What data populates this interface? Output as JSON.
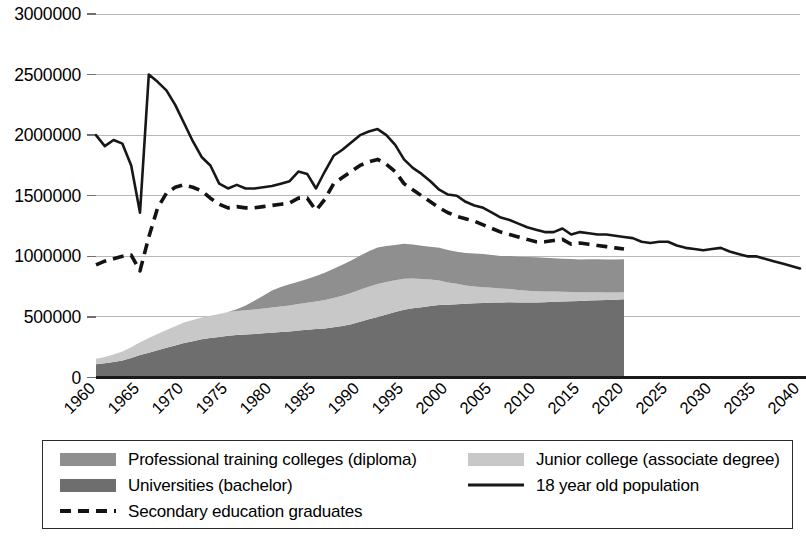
{
  "chart_data": {
    "type": "area",
    "title": "",
    "subtitle": "",
    "xlabel": "",
    "ylabel": "",
    "xlim": [
      1960,
      2040
    ],
    "ylim": [
      0,
      3000000
    ],
    "grid": true,
    "stacked": true,
    "legend_position": "bottom",
    "x_tick_labels": [
      "1960",
      "1965",
      "1970",
      "1975",
      "1980",
      "1985",
      "1990",
      "1995",
      "2000",
      "2005",
      "2010",
      "2015",
      "2020",
      "2025",
      "2030",
      "2035",
      "2040"
    ],
    "y_tick_labels": [
      "0",
      "500000",
      "1000000",
      "1500000",
      "2000000",
      "2500000",
      "3000000"
    ],
    "y_tick_values": [
      0,
      500000,
      1000000,
      1500000,
      2000000,
      2500000,
      3000000
    ],
    "area_x_start": 1960,
    "area_x_end": 2020,
    "area_x": [
      1960,
      1961,
      1962,
      1963,
      1964,
      1965,
      1966,
      1967,
      1968,
      1969,
      1970,
      1971,
      1972,
      1973,
      1974,
      1975,
      1976,
      1977,
      1978,
      1979,
      1980,
      1981,
      1982,
      1983,
      1984,
      1985,
      1986,
      1987,
      1988,
      1989,
      1990,
      1991,
      1992,
      1993,
      1994,
      1995,
      1996,
      1997,
      1998,
      1999,
      2000,
      2001,
      2002,
      2003,
      2004,
      2005,
      2006,
      2007,
      2008,
      2009,
      2010,
      2011,
      2012,
      2013,
      2014,
      2015,
      2016,
      2017,
      2018,
      2019,
      2020
    ],
    "series": [
      {
        "name": "Universities (bachelor)",
        "legend_key": "universities",
        "color": "#6e6e6e",
        "type": "stacked-area",
        "values": [
          110000,
          118000,
          128000,
          140000,
          160000,
          185000,
          205000,
          225000,
          245000,
          265000,
          285000,
          300000,
          315000,
          325000,
          335000,
          345000,
          350000,
          355000,
          360000,
          365000,
          370000,
          375000,
          380000,
          388000,
          395000,
          400000,
          405000,
          415000,
          425000,
          440000,
          460000,
          480000,
          500000,
          520000,
          540000,
          560000,
          572000,
          580000,
          590000,
          598000,
          600000,
          605000,
          608000,
          612000,
          615000,
          618000,
          620000,
          622000,
          620000,
          618000,
          620000,
          622000,
          625000,
          628000,
          630000,
          632000,
          635000,
          638000,
          640000,
          642000,
          645000
        ]
      },
      {
        "name": "Junior college (associate degree)",
        "legend_key": "junior_college",
        "color": "#c8c8c8",
        "type": "stacked-area",
        "values": [
          45000,
          52000,
          62000,
          75000,
          90000,
          105000,
          120000,
          135000,
          148000,
          158000,
          168000,
          175000,
          180000,
          185000,
          190000,
          195000,
          198000,
          200000,
          202000,
          205000,
          208000,
          212000,
          215000,
          218000,
          222000,
          228000,
          235000,
          242000,
          250000,
          258000,
          265000,
          270000,
          272000,
          268000,
          262000,
          255000,
          245000,
          232000,
          218000,
          202000,
          185000,
          168000,
          152000,
          140000,
          130000,
          122000,
          115000,
          108000,
          102000,
          98000,
          92000,
          88000,
          84000,
          80000,
          76000,
          72000,
          68000,
          65000,
          62000,
          60000,
          58000
        ]
      },
      {
        "name": "Professional training colleges (diploma)",
        "legend_key": "professional_training",
        "color": "#8f8f8f",
        "type": "stacked-area",
        "values": [
          0,
          0,
          0,
          0,
          0,
          0,
          0,
          0,
          0,
          0,
          0,
          0,
          0,
          0,
          0,
          0,
          15000,
          40000,
          72000,
          105000,
          140000,
          160000,
          175000,
          185000,
          195000,
          210000,
          225000,
          240000,
          255000,
          268000,
          280000,
          292000,
          300000,
          298000,
          292000,
          288000,
          280000,
          275000,
          272000,
          270000,
          268000,
          265000,
          268000,
          272000,
          275000,
          272000,
          268000,
          272000,
          275000,
          278000,
          280000,
          278000,
          275000,
          272000,
          272000,
          270000,
          272000,
          272000,
          272000,
          272000,
          272000
        ]
      },
      {
        "name": "18 year old population",
        "legend_key": "population_18",
        "color": "#171717",
        "type": "line",
        "style": "solid",
        "x": [
          1960,
          1961,
          1962,
          1963,
          1964,
          1965,
          1966,
          1967,
          1968,
          1969,
          1970,
          1971,
          1972,
          1973,
          1974,
          1975,
          1976,
          1977,
          1978,
          1979,
          1980,
          1981,
          1982,
          1983,
          1984,
          1985,
          1986,
          1987,
          1988,
          1989,
          1990,
          1991,
          1992,
          1993,
          1994,
          1995,
          1996,
          1997,
          1998,
          1999,
          2000,
          2001,
          2002,
          2003,
          2004,
          2005,
          2006,
          2007,
          2008,
          2009,
          2010,
          2011,
          2012,
          2013,
          2014,
          2015,
          2016,
          2017,
          2018,
          2019,
          2020,
          2021,
          2022,
          2023,
          2024,
          2025,
          2026,
          2027,
          2028,
          2029,
          2030,
          2031,
          2032,
          2033,
          2034,
          2035,
          2036,
          2037,
          2038,
          2039,
          2040
        ],
        "values": [
          2000000,
          1910000,
          1960000,
          1930000,
          1750000,
          1360000,
          2500000,
          2440000,
          2370000,
          2250000,
          2100000,
          1950000,
          1820000,
          1750000,
          1600000,
          1560000,
          1590000,
          1560000,
          1560000,
          1570000,
          1580000,
          1600000,
          1620000,
          1700000,
          1680000,
          1560000,
          1700000,
          1830000,
          1880000,
          1940000,
          2000000,
          2030000,
          2050000,
          2000000,
          1920000,
          1800000,
          1730000,
          1680000,
          1620000,
          1550000,
          1510000,
          1500000,
          1450000,
          1420000,
          1400000,
          1360000,
          1320000,
          1300000,
          1270000,
          1240000,
          1220000,
          1200000,
          1200000,
          1230000,
          1180000,
          1200000,
          1190000,
          1180000,
          1180000,
          1170000,
          1160000,
          1150000,
          1120000,
          1110000,
          1120000,
          1120000,
          1090000,
          1070000,
          1060000,
          1050000,
          1060000,
          1070000,
          1040000,
          1020000,
          1000000,
          1000000,
          980000,
          960000,
          940000,
          920000,
          900000
        ]
      },
      {
        "name": "Secondary education graduates",
        "legend_key": "secondary_graduates",
        "color": "#131313",
        "type": "line",
        "style": "dashed",
        "x": [
          1960,
          1961,
          1962,
          1963,
          1964,
          1965,
          1966,
          1967,
          1968,
          1969,
          1970,
          1971,
          1972,
          1973,
          1974,
          1975,
          1976,
          1977,
          1978,
          1979,
          1980,
          1981,
          1982,
          1983,
          1984,
          1985,
          1986,
          1987,
          1988,
          1989,
          1990,
          1991,
          1992,
          1993,
          1994,
          1995,
          1996,
          1997,
          1998,
          1999,
          2000,
          2001,
          2002,
          2003,
          2004,
          2005,
          2006,
          2007,
          2008,
          2009,
          2010,
          2011,
          2012,
          2013,
          2014,
          2015,
          2016,
          2017,
          2018,
          2019,
          2020
        ],
        "values": [
          930000,
          960000,
          980000,
          1000000,
          1010000,
          880000,
          1160000,
          1400000,
          1520000,
          1570000,
          1590000,
          1570000,
          1540000,
          1480000,
          1430000,
          1400000,
          1410000,
          1400000,
          1400000,
          1410000,
          1420000,
          1430000,
          1440000,
          1480000,
          1480000,
          1380000,
          1470000,
          1600000,
          1650000,
          1700000,
          1750000,
          1780000,
          1800000,
          1760000,
          1700000,
          1600000,
          1550000,
          1500000,
          1450000,
          1400000,
          1360000,
          1330000,
          1310000,
          1290000,
          1260000,
          1230000,
          1200000,
          1180000,
          1160000,
          1140000,
          1120000,
          1120000,
          1130000,
          1140000,
          1100000,
          1110000,
          1100000,
          1090000,
          1080000,
          1070000,
          1060000
        ]
      }
    ],
    "legend": {
      "items": [
        {
          "label": "Professional training colleges (diploma)",
          "marker": "swatch",
          "color": "#8f8f8f",
          "column": 1,
          "row": 1
        },
        {
          "label": "Junior college (associate degree)",
          "marker": "swatch",
          "color": "#c8c8c8",
          "column": 2,
          "row": 1
        },
        {
          "label": "Universities (bachelor)",
          "marker": "swatch",
          "color": "#6e6e6e",
          "column": 1,
          "row": 2
        },
        {
          "label": "18 year old population",
          "marker": "solid-line",
          "color": "#171717",
          "column": 2,
          "row": 2
        },
        {
          "label": "Secondary education graduates",
          "marker": "dashed-line",
          "color": "#131313",
          "column": 1,
          "row": 3
        }
      ]
    },
    "colors": {
      "professional_training": "#8f8f8f",
      "junior_college": "#c8c8c8",
      "universities": "#6e6e6e",
      "population_line": "#171717",
      "secondary_line": "#131313",
      "gridline": "#b8b8b8",
      "axis": "#1a1a1a",
      "background": "#ffffff"
    }
  }
}
